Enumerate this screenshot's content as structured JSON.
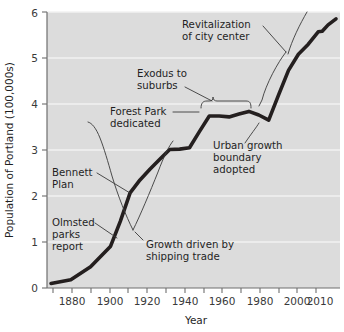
{
  "chart_data": {
    "type": "line",
    "title": "",
    "xlabel": "Year",
    "ylabel": "Population of Portland (100,000s)",
    "xlim": [
      1868,
      2016
    ],
    "ylim": [
      0,
      6
    ],
    "grid": true,
    "legend": "none",
    "background_color": "#dcdcdc",
    "line_color": "#241f1f",
    "gridline_color": "#f2f2f2",
    "x_tick_labels": [
      "1880",
      "1900",
      "1920",
      "1940",
      "1960",
      "1980",
      "2000",
      "2010"
    ],
    "x_tick_values": [
      1880,
      1900,
      1920,
      1940,
      1960,
      1980,
      2000,
      2010
    ],
    "x_minor_ticks": [
      1870,
      1890,
      1910,
      1930,
      1950,
      1970,
      1990,
      2010
    ],
    "y_tick_labels": [
      "0",
      "1",
      "2",
      "3",
      "4",
      "5",
      "6"
    ],
    "y_tick_values": [
      0,
      1,
      2,
      3,
      4,
      5,
      6
    ],
    "series": [
      {
        "name": "Population of Portland",
        "x": [
          1870,
          1880,
          1890,
          1900,
          1905,
          1910,
          1915,
          1920,
          1925,
          1930,
          1935,
          1940,
          1945,
          1950,
          1955,
          1960,
          1965,
          1970,
          1975,
          1980,
          1985,
          1990,
          1995,
          2000,
          2005,
          2007,
          2010,
          2014
        ],
        "values": [
          0.1,
          0.18,
          0.46,
          0.9,
          1.45,
          2.07,
          2.35,
          2.58,
          2.8,
          3.01,
          3.02,
          3.05,
          3.4,
          3.74,
          3.74,
          3.72,
          3.78,
          3.84,
          3.76,
          3.65,
          4.2,
          4.73,
          5.08,
          5.3,
          5.57,
          5.58,
          5.72,
          5.85
        ]
      }
    ],
    "annotations": [
      {
        "id": "revitalization",
        "lines": [
          "Revitalization",
          "of city center"
        ],
        "points_to": "steep rise after 1980"
      },
      {
        "id": "exodus",
        "lines": [
          "Exodus to",
          "suburbs"
        ],
        "points_to": "plateau 1950-1980 (brace)"
      },
      {
        "id": "forest-park",
        "lines": [
          "Forest Park",
          "dedicated"
        ],
        "points_to": "1948 on the curve"
      },
      {
        "id": "urban-growth",
        "lines": [
          "Urban growth",
          "boundary",
          "adopted"
        ],
        "points_to": "1979 on the curve"
      },
      {
        "id": "bennett-plan",
        "lines": [
          "Bennett",
          "Plan"
        ],
        "points_to": "1912 on the curve"
      },
      {
        "id": "olmsted",
        "lines": [
          "Olmsted",
          "parks",
          "report"
        ],
        "points_to": "1903 on the curve"
      },
      {
        "id": "shipping-trade",
        "lines": [
          "Growth driven by",
          "shipping trade"
        ],
        "points_to": "1890-1935 span"
      }
    ]
  }
}
